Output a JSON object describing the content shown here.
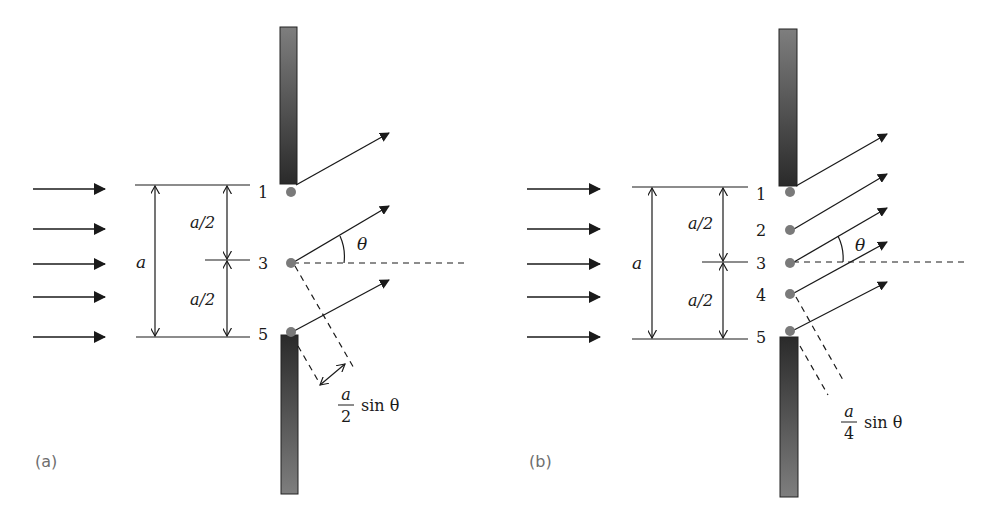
{
  "colors": {
    "line": "#1a1a1a",
    "dot": "#7a7a7a",
    "barrier_dark": "#2a2a2a",
    "barrier_light": "#7e7e7e",
    "panel_label": "#6e6e6e"
  },
  "panels": [
    {
      "id": "a",
      "label": "(a)",
      "point_labels": [
        "1",
        "3",
        "5"
      ],
      "dimension_total": "a",
      "dimension_half_top": "a/2",
      "dimension_half_bottom": "a/2",
      "angle_label": "θ",
      "path_difference": {
        "numerator": "a",
        "denominator": "2",
        "suffix": "sin θ"
      }
    },
    {
      "id": "b",
      "label": "(b)",
      "point_labels": [
        "1",
        "2",
        "3",
        "4",
        "5"
      ],
      "dimension_total": "a",
      "dimension_half_top": "a/2",
      "dimension_half_bottom": "a/2",
      "angle_label": "θ",
      "path_difference": {
        "numerator": "a",
        "denominator": "4",
        "suffix": "sin θ"
      }
    }
  ]
}
